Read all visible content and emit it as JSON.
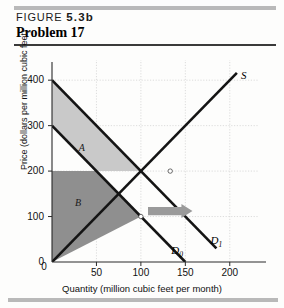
{
  "figure": {
    "label_word": "FIGURE",
    "label_number": "5.3b",
    "problem_title": "Problem 17"
  },
  "chart_data": {
    "type": "line",
    "title": "",
    "xlabel": "Quantity (million cubic feet per month)",
    "ylabel": "Price (dollars per million cubic feet)",
    "xlim": [
      0,
      225
    ],
    "ylim": [
      0,
      440
    ],
    "xticks": [
      0,
      50,
      100,
      150,
      200
    ],
    "xtick_labels": [
      "0",
      "50",
      "100",
      "150",
      "200"
    ],
    "yticks": [
      0,
      100,
      200,
      300,
      400
    ],
    "ytick_labels": [
      "0",
      "100",
      "200",
      "300",
      "400"
    ],
    "grid": true,
    "legend": "none",
    "series": [
      {
        "name": "S",
        "label": "S",
        "type": "supply",
        "points": [
          [
            0,
            0
          ],
          [
            208,
            416
          ]
        ]
      },
      {
        "name": "D0",
        "label": "D",
        "sublabel": "0",
        "type": "demand",
        "points": [
          [
            0,
            300
          ],
          [
            150,
            0
          ]
        ]
      },
      {
        "name": "D1",
        "label": "D",
        "sublabel": "1",
        "type": "demand",
        "points": [
          [
            0,
            400
          ],
          [
            185,
            30
          ]
        ]
      }
    ],
    "equilibria": [
      {
        "name": "initial",
        "x": 100,
        "y": 100
      },
      {
        "name": "new",
        "x": 133,
        "y": 200
      }
    ],
    "regions": [
      {
        "label": "A",
        "fill": "#c9c9c9",
        "description": "area between D0 and D1 above price 200"
      },
      {
        "label": "B",
        "fill": "#8f8f8f",
        "description": "area below price 200 bounded by D0 and S"
      }
    ],
    "annotations": [
      {
        "name": "shift-arrow",
        "type": "arrow",
        "direction": "right",
        "from": [
          108,
          112
        ],
        "to": [
          158,
          112
        ],
        "color": "#9a9a9a"
      }
    ]
  },
  "colors": {
    "curve": "#141414",
    "region_a": "#c9c9c9",
    "region_b": "#8f8f8f",
    "arrow": "#9a9a9a",
    "rule": "#b9b9b9",
    "axis": "#3a3a3a"
  }
}
